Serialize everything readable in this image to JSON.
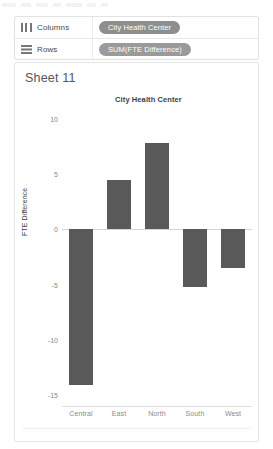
{
  "app": {
    "top_strip_ghost_widths": [
      14,
      10,
      12,
      8,
      16,
      9,
      7
    ]
  },
  "shelves": {
    "columns": {
      "icon": "columns-grid-icon",
      "label": "Columns",
      "pill": "City Health Center"
    },
    "rows": {
      "icon": "rows-grid-icon",
      "label": "Rows",
      "pill": "SUM(FTE Difference)"
    }
  },
  "worksheet": {
    "sheet_title": "Sheet 11"
  },
  "chart_data": {
    "type": "bar",
    "title": "City Health Center",
    "xlabel": "",
    "ylabel": "FTE Difference",
    "categories": [
      "Central",
      "East",
      "North",
      "South",
      "West"
    ],
    "values": [
      -14.1,
      4.5,
      7.8,
      -5.2,
      -3.5
    ],
    "yticks": [
      10,
      5,
      0,
      -5,
      -10,
      -15
    ],
    "ytick_labels": [
      "10",
      "5",
      "0",
      "-5",
      "-10",
      "-15"
    ],
    "ylim": [
      -16,
      11
    ],
    "grid": false,
    "legend": "none",
    "bar_color": "#595959"
  }
}
